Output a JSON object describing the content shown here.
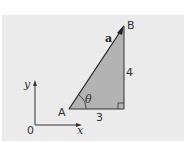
{
  "diagram": {
    "points": {
      "A": "A",
      "B": "B",
      "O": "0"
    },
    "vector_label": "a",
    "angle_label": "θ",
    "horizontal_side": "3",
    "vertical_side": "4",
    "axes": {
      "x": "x",
      "y": "y"
    },
    "colors": {
      "panel": "#ebebeb",
      "triangle": "#b3b3b3",
      "lines": "#333333"
    }
  }
}
